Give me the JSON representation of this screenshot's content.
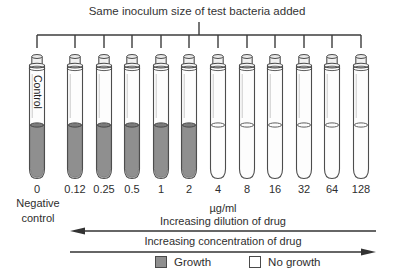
{
  "title": "Same inoculum size of test bacteria added",
  "tubes": [
    {
      "label": "0",
      "growth": true,
      "tube_text": "Control"
    },
    {
      "label": "0.12",
      "growth": true
    },
    {
      "label": "0.25",
      "growth": true
    },
    {
      "label": "0.5",
      "growth": true
    },
    {
      "label": "1",
      "growth": true
    },
    {
      "label": "2",
      "growth": true
    },
    {
      "label": "4",
      "growth": false
    },
    {
      "label": "8",
      "growth": false
    },
    {
      "label": "16",
      "growth": false
    },
    {
      "label": "32",
      "growth": false
    },
    {
      "label": "64",
      "growth": false
    },
    {
      "label": "128",
      "growth": false
    }
  ],
  "negative_control_label": "Negative control",
  "unit_label": "µg/ml",
  "dilution_arrow_label": "Increasing dilution of drug",
  "concentration_arrow_label": "Increasing concentration of drug",
  "legend": {
    "growth_label": "Growth",
    "no_growth_label": "No growth"
  },
  "colors": {
    "growth_fill": "#8f8f8f",
    "growth_surface": "#7b7b7b",
    "line": "#3c3c3c"
  }
}
